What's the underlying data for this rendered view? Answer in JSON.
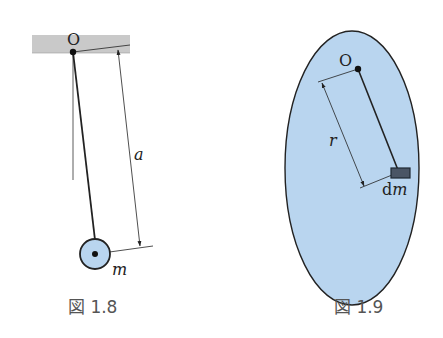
{
  "figures": [
    {
      "id": "fig-1-8",
      "caption": "図 1.8",
      "labels": {
        "pivot": "O",
        "length": "a",
        "mass": "m"
      },
      "description": "Simple pendulum: bob of mass m on a rod of length a hanging from pivot O on a ceiling"
    },
    {
      "id": "fig-1-9",
      "caption": "図 1.9",
      "labels": {
        "pivot": "O",
        "distance": "r",
        "mass_element": "dm"
      },
      "description": "Rigid body (ellipse) pivoted at O with mass element dm at distance r"
    }
  ],
  "colors": {
    "ceiling": "#c9c9c9",
    "body_fill": "#b9d5ef",
    "bob_fill": "#b9d5ef",
    "line": "#222222",
    "mass_element": "#3a4656",
    "caption": "#555555"
  }
}
